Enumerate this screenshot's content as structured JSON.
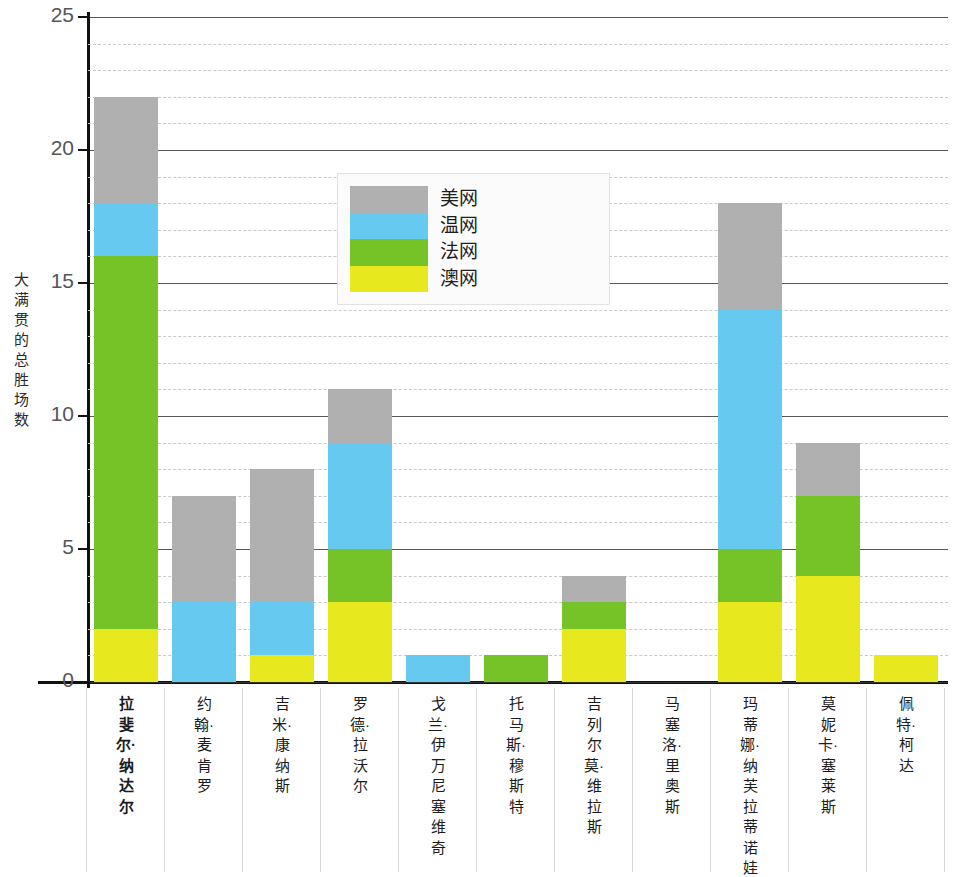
{
  "chart_data": {
    "type": "bar",
    "stacked": true,
    "title": "",
    "xlabel": "",
    "ylabel": "大满贯的总胜场数",
    "ylim": [
      0,
      25
    ],
    "y_major_ticks": [
      0,
      5,
      10,
      15,
      20,
      25
    ],
    "y_minor_step": 1,
    "grid": true,
    "legend_position": "inside-upper-left",
    "series": [
      {
        "name": "澳网",
        "color": "#e8e81f",
        "values": [
          2,
          0,
          1,
          3,
          0,
          0,
          2,
          0,
          3,
          4,
          1
        ]
      },
      {
        "name": "法网",
        "color": "#76c327",
        "values": [
          14,
          0,
          0,
          2,
          0,
          1,
          1,
          0,
          2,
          3,
          0
        ]
      },
      {
        "name": "温网",
        "color": "#66c9ef",
        "values": [
          2,
          3,
          2,
          4,
          1,
          0,
          0,
          0,
          9,
          0,
          0
        ]
      },
      {
        "name": "美网",
        "color": "#b0b0b0",
        "values": [
          4,
          4,
          5,
          2,
          0,
          0,
          1,
          0,
          4,
          2,
          0
        ]
      }
    ],
    "stack_order_bottom_to_top": [
      "澳网",
      "法网",
      "温网",
      "美网"
    ],
    "categories": [
      "拉斐尔·纳达尔",
      "约翰·麦肯罗",
      "吉米·康纳斯",
      "罗德·拉沃尔",
      "戈兰·伊万尼塞维奇",
      "托马斯·穆斯特",
      "吉列尔莫·维拉斯",
      "马塞洛·里奥斯",
      "玛蒂娜·纳芙拉蒂诺娃",
      "莫妮卡·塞莱斯",
      "佩特·柯达"
    ],
    "category_totals": [
      22,
      7,
      8,
      11,
      1,
      1,
      4,
      0,
      18,
      9,
      1
    ],
    "highlighted_category": "拉斐尔·纳达尔"
  },
  "axis": {
    "y_tick_labels": [
      "25",
      "20",
      "15",
      "10",
      "5",
      "0"
    ]
  },
  "legend": {
    "entries": [
      {
        "label": "美网",
        "color": "#b0b0b0"
      },
      {
        "label": "温网",
        "color": "#66c9ef"
      },
      {
        "label": "法网",
        "color": "#76c327"
      },
      {
        "label": "澳网",
        "color": "#e8e81f"
      }
    ]
  }
}
